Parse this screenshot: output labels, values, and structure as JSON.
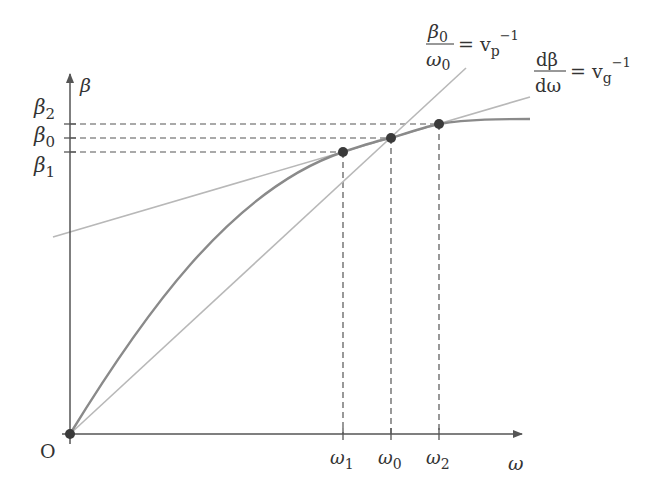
{
  "diagram": {
    "axes": {
      "x_label": "ω",
      "y_label": "β",
      "origin_label": "O"
    },
    "x_ticks": [
      {
        "label": "ω",
        "sub": "1",
        "x": 343
      },
      {
        "label": "ω",
        "sub": "0",
        "x": 391
      },
      {
        "label": "ω",
        "sub": "2",
        "x": 439
      }
    ],
    "y_ticks": [
      {
        "label": "β",
        "sub": "2",
        "y": 124
      },
      {
        "label": "β",
        "sub": "0",
        "y": 138
      },
      {
        "label": "β",
        "sub": "1",
        "y": 152
      }
    ],
    "points": [
      {
        "name": "origin",
        "x": 70,
        "y": 434
      },
      {
        "name": "point-1",
        "x": 343,
        "y": 152
      },
      {
        "name": "point-0",
        "x": 391,
        "y": 138
      },
      {
        "name": "point-2",
        "x": 439,
        "y": 124
      }
    ],
    "annotations": {
      "phase": {
        "num": "β",
        "num_sub": "0",
        "den": "ω",
        "den_sub": "0",
        "rhs": "= v",
        "rhs_sub": "p",
        "rhs_sup": "−1"
      },
      "group": {
        "num": "dβ",
        "den": "dω",
        "rhs": "= v",
        "rhs_sub": "g",
        "rhs_sup": "−1"
      }
    },
    "colors": {
      "axis": "#555555",
      "curve": "#8a8a8a",
      "tangent": "#b5b5b5",
      "point": "#3a3a3a",
      "dashed": "#555555"
    }
  }
}
